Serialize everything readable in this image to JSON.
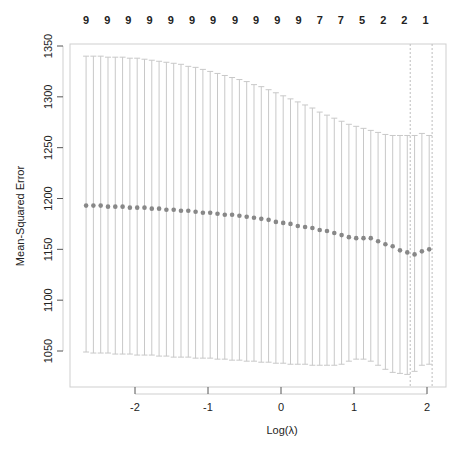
{
  "chart_data": {
    "type": "scatter",
    "title": "",
    "xlabel": "Log(λ)",
    "ylabel": "Mean-Squared Error",
    "xlim": [
      -2.78,
      2.37
    ],
    "ylim": [
      1016,
      1352
    ],
    "x_ticks": [
      -2,
      -1,
      0,
      1,
      2
    ],
    "x_tick_labels": [
      "-2",
      "-1",
      "0",
      "1",
      "2"
    ],
    "y_ticks": [
      1050,
      1100,
      1150,
      1200,
      1250,
      1300,
      1350
    ],
    "y_tick_labels": [
      "1050",
      "1100",
      "1150",
      "1200",
      "1250",
      "1300",
      "1350"
    ],
    "grid": false,
    "legend": null,
    "top_axis_labels": [
      "9",
      "9",
      "9",
      "9",
      "9",
      "9",
      "9",
      "9",
      "9",
      "9",
      "9",
      "7",
      "7",
      "5",
      "2",
      "2",
      "1"
    ],
    "top_axis_positions": [
      -2.67,
      -2.38,
      -2.09,
      -1.8,
      -1.51,
      -1.22,
      -0.93,
      -0.63,
      -0.34,
      -0.05,
      0.24,
      0.53,
      0.82,
      1.11,
      1.4,
      1.69,
      1.98
    ],
    "vlines": [
      {
        "x": 1.77,
        "style": "dotted",
        "label": "lambda.min"
      },
      {
        "x": 2.07,
        "style": "dotted",
        "label": "lambda.1se"
      }
    ],
    "series": [
      {
        "name": "cv mean",
        "color": "#888888",
        "x": [
          -2.67,
          -2.57,
          -2.47,
          -2.37,
          -2.27,
          -2.17,
          -2.07,
          -1.97,
          -1.87,
          -1.77,
          -1.67,
          -1.57,
          -1.47,
          -1.37,
          -1.27,
          -1.17,
          -1.07,
          -0.97,
          -0.87,
          -0.77,
          -0.67,
          -0.57,
          -0.47,
          -0.37,
          -0.27,
          -0.17,
          -0.07,
          0.03,
          0.13,
          0.23,
          0.33,
          0.43,
          0.53,
          0.63,
          0.73,
          0.83,
          0.93,
          1.03,
          1.13,
          1.23,
          1.33,
          1.43,
          1.53,
          1.63,
          1.73,
          1.83,
          1.93,
          2.03
        ],
        "y": [
          1193,
          1193,
          1193,
          1192,
          1192,
          1192,
          1191,
          1191,
          1191,
          1190,
          1190,
          1189,
          1189,
          1188,
          1188,
          1187,
          1186,
          1186,
          1185,
          1184,
          1184,
          1183,
          1182,
          1181,
          1180,
          1179,
          1177,
          1176,
          1175,
          1173,
          1172,
          1171,
          1169,
          1168,
          1166,
          1164,
          1162,
          1161,
          1161,
          1161,
          1158,
          1155,
          1153,
          1149,
          1147,
          1145,
          1148,
          1150
        ],
        "upper": [
          1340,
          1340,
          1340,
          1339,
          1339,
          1339,
          1338,
          1338,
          1337,
          1336,
          1335,
          1334,
          1333,
          1332,
          1330,
          1329,
          1327,
          1325,
          1323,
          1321,
          1319,
          1317,
          1315,
          1312,
          1310,
          1307,
          1304,
          1301,
          1298,
          1295,
          1292,
          1289,
          1285,
          1282,
          1279,
          1276,
          1273,
          1271,
          1269,
          1267,
          1265,
          1263,
          1262,
          1262,
          1262,
          1262,
          1264,
          1262
        ],
        "lower": [
          1049,
          1048,
          1048,
          1048,
          1047,
          1047,
          1047,
          1046,
          1046,
          1046,
          1045,
          1045,
          1044,
          1044,
          1044,
          1043,
          1043,
          1043,
          1042,
          1042,
          1041,
          1041,
          1040,
          1040,
          1039,
          1039,
          1038,
          1038,
          1037,
          1037,
          1037,
          1036,
          1036,
          1036,
          1036,
          1037,
          1040,
          1042,
          1042,
          1040,
          1036,
          1032,
          1029,
          1028,
          1027,
          1030,
          1036,
          1037
        ]
      }
    ]
  }
}
